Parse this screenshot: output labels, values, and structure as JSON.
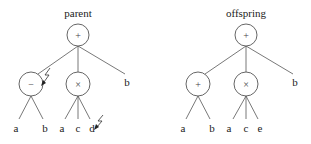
{
  "parent": {
    "title": "parent",
    "root": {
      "op": "+"
    },
    "children": [
      {
        "op": "−",
        "leaves": [
          "a",
          "b"
        ],
        "mutated": true
      },
      {
        "op": "×",
        "leaves": [
          "a",
          "c",
          "d"
        ],
        "mutated_leaf": "d"
      },
      {
        "leaf": "b"
      }
    ]
  },
  "offspring": {
    "title": "offspring",
    "root": {
      "op": "+"
    },
    "children": [
      {
        "op": "+",
        "leaves": [
          "a",
          "b"
        ]
      },
      {
        "op": "×",
        "leaves": [
          "a",
          "c",
          "e"
        ]
      },
      {
        "leaf": "b"
      }
    ]
  },
  "icons": {
    "mutation": "lightning-bolt-icon"
  }
}
